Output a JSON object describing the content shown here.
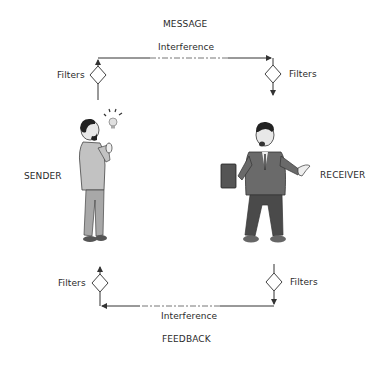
{
  "diagram": {
    "top_label": "MESSAGE",
    "bottom_label": "FEEDBACK",
    "sender_label": "SENDER",
    "receiver_label": "RECEIVER",
    "top_interference_label": "Interference",
    "bottom_interference_label": "Interference",
    "filters": {
      "top_left": "Filters",
      "top_right": "Filters",
      "bottom_left": "Filters",
      "bottom_right": "Filters"
    },
    "figures": {
      "sender": "man-with-idea-lightbulb",
      "receiver": "man-holding-folder-gesturing"
    },
    "colors": {
      "line": "#333333",
      "suit_light": "#b8b8b8",
      "suit_dark": "#5a5a5a",
      "text": "#2a2a2a"
    }
  }
}
